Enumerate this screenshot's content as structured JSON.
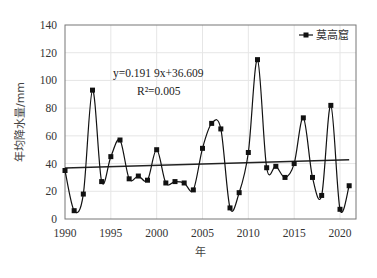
{
  "chart_data": {
    "type": "line",
    "title": "",
    "xlabel": "年",
    "ylabel": "年均降水量/mm",
    "xlim": [
      1990,
      2021
    ],
    "ylim": [
      0,
      140
    ],
    "x_ticks": [
      "1990",
      "1995",
      "2000",
      "2005",
      "2010",
      "2015",
      "2020"
    ],
    "y_ticks": [
      "0",
      "20",
      "40",
      "60",
      "80",
      "100",
      "120",
      "140"
    ],
    "grid": true,
    "legend_position": "top-right",
    "x": [
      1990,
      1991,
      1992,
      1993,
      1994,
      1995,
      1996,
      1997,
      1998,
      1999,
      2000,
      2001,
      2002,
      2003,
      2004,
      2005,
      2006,
      2007,
      2008,
      2009,
      2010,
      2011,
      2012,
      2013,
      2014,
      2015,
      2016,
      2017,
      2018,
      2019,
      2020,
      2021
    ],
    "series": [
      {
        "name": "莫高窟",
        "values": [
          35,
          6,
          18,
          93,
          27,
          45,
          57,
          29,
          31,
          28,
          50,
          26,
          27,
          26,
          21,
          51,
          69,
          65,
          8,
          19,
          48,
          115,
          37,
          38,
          30,
          40,
          73,
          30,
          17,
          82,
          7,
          24
        ]
      }
    ],
    "trendline": {
      "equation": "y=0.191 9x+36.609",
      "r_squared": "R²=0.005",
      "slope": 0.1919,
      "intercept": 36.609
    }
  },
  "labels": {
    "legend": "莫高窟",
    "equation": "y=0.191 9x+36.609",
    "r2": "R²=0.005",
    "xlabel": "年",
    "ylabel": "年均降水量/mm"
  }
}
